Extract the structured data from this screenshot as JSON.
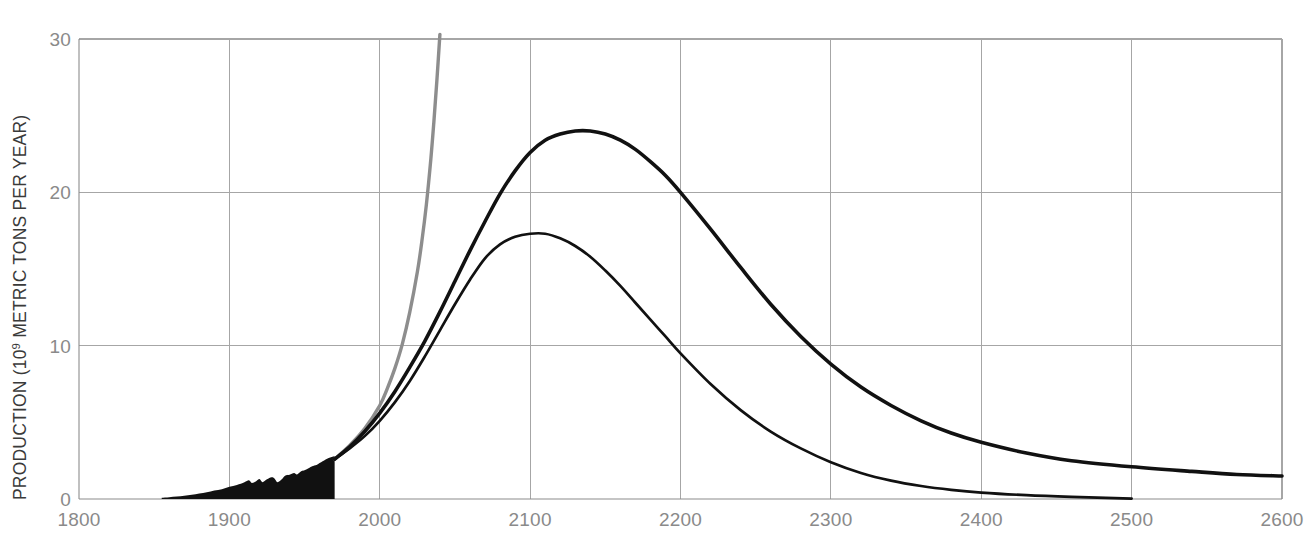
{
  "chart_data": {
    "type": "line",
    "title": "",
    "subtitle": "",
    "xlabel": "",
    "ylabel": "PRODUCTION (10⁹ METRIC TONS PER YEAR)",
    "ylabel_parts": {
      "prefix": "PRODUCTION (10",
      "exponent": "9",
      "suffix": " METRIC TONS PER YEAR)"
    },
    "xlim": [
      1800,
      2600
    ],
    "ylim": [
      0,
      30
    ],
    "grid": true,
    "legend_position": "none",
    "xticks": [
      1800,
      1900,
      2000,
      2100,
      2200,
      2300,
      2400,
      2500,
      2600
    ],
    "xtick_labels": [
      "1800",
      "1900",
      "2000",
      "2100",
      "2200",
      "2300",
      "2400",
      "2500",
      "2600"
    ],
    "yticks": [
      0,
      10,
      20,
      30
    ],
    "ytick_labels": [
      "0",
      "10",
      "20",
      "30"
    ],
    "colors": {
      "curve_high": "#111111",
      "curve_low": "#111111",
      "exponential": "#8d8d8d",
      "historical": "#111111",
      "grid": "#a6a6a6",
      "axis": "#8c8c8c",
      "tick_text": "#8a8a8a",
      "axis_title_text": "#3a3a3a"
    },
    "series": [
      {
        "name": "high-estimate-cycle",
        "style": "thick-black-line",
        "peak_year": 2140,
        "peak_value": 24.0,
        "points": [
          [
            1970,
            2.6
          ],
          [
            1980,
            3.4
          ],
          [
            1990,
            4.4
          ],
          [
            2000,
            5.6
          ],
          [
            2010,
            7.0
          ],
          [
            2020,
            8.6
          ],
          [
            2030,
            10.3
          ],
          [
            2040,
            12.2
          ],
          [
            2050,
            14.2
          ],
          [
            2060,
            16.2
          ],
          [
            2070,
            18.1
          ],
          [
            2080,
            19.9
          ],
          [
            2090,
            21.4
          ],
          [
            2100,
            22.6
          ],
          [
            2110,
            23.4
          ],
          [
            2120,
            23.8
          ],
          [
            2130,
            24.0
          ],
          [
            2140,
            24.0
          ],
          [
            2150,
            23.8
          ],
          [
            2160,
            23.4
          ],
          [
            2170,
            22.8
          ],
          [
            2180,
            22.0
          ],
          [
            2190,
            21.1
          ],
          [
            2200,
            20.0
          ],
          [
            2220,
            17.6
          ],
          [
            2240,
            15.1
          ],
          [
            2260,
            12.7
          ],
          [
            2280,
            10.6
          ],
          [
            2300,
            8.8
          ],
          [
            2320,
            7.3
          ],
          [
            2340,
            6.1
          ],
          [
            2360,
            5.1
          ],
          [
            2380,
            4.3
          ],
          [
            2400,
            3.7
          ],
          [
            2430,
            3.0
          ],
          [
            2460,
            2.5
          ],
          [
            2500,
            2.1
          ],
          [
            2540,
            1.8
          ],
          [
            2570,
            1.6
          ],
          [
            2600,
            1.5
          ]
        ]
      },
      {
        "name": "low-estimate-cycle",
        "style": "thin-black-line",
        "peak_year": 2105,
        "peak_value": 17.3,
        "points": [
          [
            1970,
            2.6
          ],
          [
            1980,
            3.3
          ],
          [
            1990,
            4.1
          ],
          [
            2000,
            5.1
          ],
          [
            2010,
            6.3
          ],
          [
            2020,
            7.7
          ],
          [
            2030,
            9.3
          ],
          [
            2040,
            11.0
          ],
          [
            2050,
            12.7
          ],
          [
            2060,
            14.3
          ],
          [
            2070,
            15.7
          ],
          [
            2080,
            16.6
          ],
          [
            2090,
            17.1
          ],
          [
            2100,
            17.3
          ],
          [
            2110,
            17.3
          ],
          [
            2120,
            17.0
          ],
          [
            2130,
            16.5
          ],
          [
            2140,
            15.8
          ],
          [
            2150,
            14.9
          ],
          [
            2160,
            13.9
          ],
          [
            2170,
            12.8
          ],
          [
            2180,
            11.7
          ],
          [
            2190,
            10.6
          ],
          [
            2200,
            9.5
          ],
          [
            2220,
            7.5
          ],
          [
            2240,
            5.8
          ],
          [
            2260,
            4.4
          ],
          [
            2280,
            3.3
          ],
          [
            2300,
            2.4
          ],
          [
            2320,
            1.7
          ],
          [
            2340,
            1.2
          ],
          [
            2360,
            0.85
          ],
          [
            2380,
            0.6
          ],
          [
            2400,
            0.42
          ],
          [
            2430,
            0.25
          ],
          [
            2460,
            0.14
          ],
          [
            2500,
            0.03
          ]
        ]
      },
      {
        "name": "continued-exponential-growth",
        "style": "gray-line",
        "points": [
          [
            1970,
            2.6
          ],
          [
            1980,
            3.5
          ],
          [
            1990,
            4.6
          ],
          [
            2000,
            6.1
          ],
          [
            2005,
            7.2
          ],
          [
            2010,
            8.5
          ],
          [
            2015,
            10.1
          ],
          [
            2020,
            12.2
          ],
          [
            2025,
            14.8
          ],
          [
            2028,
            16.8
          ],
          [
            2031,
            19.2
          ],
          [
            2034,
            22.2
          ],
          [
            2036,
            24.6
          ],
          [
            2038,
            27.3
          ],
          [
            2040,
            30.3
          ]
        ]
      }
    ],
    "historical": {
      "name": "historical-production",
      "style": "filled-black-area",
      "start_year": 1855,
      "end_year": 1970,
      "points": [
        [
          1855,
          0.08
        ],
        [
          1860,
          0.12
        ],
        [
          1865,
          0.16
        ],
        [
          1870,
          0.22
        ],
        [
          1875,
          0.28
        ],
        [
          1880,
          0.36
        ],
        [
          1885,
          0.44
        ],
        [
          1890,
          0.56
        ],
        [
          1895,
          0.64
        ],
        [
          1900,
          0.8
        ],
        [
          1905,
          0.92
        ],
        [
          1910,
          1.1
        ],
        [
          1913,
          1.22
        ],
        [
          1915,
          1.05
        ],
        [
          1918,
          1.18
        ],
        [
          1920,
          1.3
        ],
        [
          1922,
          1.1
        ],
        [
          1925,
          1.28
        ],
        [
          1928,
          1.42
        ],
        [
          1930,
          1.34
        ],
        [
          1932,
          1.1
        ],
        [
          1935,
          1.3
        ],
        [
          1937,
          1.52
        ],
        [
          1940,
          1.58
        ],
        [
          1943,
          1.7
        ],
        [
          1945,
          1.6
        ],
        [
          1948,
          1.82
        ],
        [
          1950,
          1.88
        ],
        [
          1953,
          2.02
        ],
        [
          1955,
          2.14
        ],
        [
          1958,
          2.22
        ],
        [
          1960,
          2.34
        ],
        [
          1962,
          2.46
        ],
        [
          1964,
          2.58
        ],
        [
          1966,
          2.68
        ],
        [
          1968,
          2.74
        ],
        [
          1970,
          2.8
        ]
      ]
    },
    "annotations": []
  }
}
